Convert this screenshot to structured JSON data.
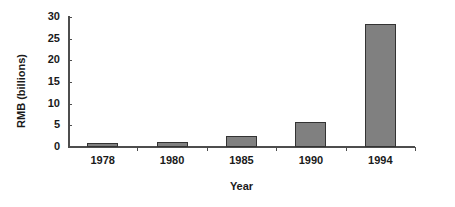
{
  "chart_data": {
    "type": "bar",
    "title": "",
    "subtitle": "",
    "categories": [
      "1978",
      "1980",
      "1985",
      "1990",
      "1994"
    ],
    "values": [
      0.9,
      1.2,
      2.5,
      5.8,
      28.5
    ],
    "series": [
      {
        "name": "RMB (billions)",
        "values": [
          0.9,
          1.2,
          2.5,
          5.8,
          28.5
        ]
      }
    ],
    "xlabel": "Year",
    "ylabel": "RMB (billions)",
    "ylim": [
      0,
      30
    ],
    "yticks": [
      "0",
      "5",
      "10",
      "15",
      "20",
      "25",
      "30"
    ],
    "ytick_values": [
      0,
      5,
      10,
      15,
      20,
      25,
      30
    ],
    "grid": false,
    "legend": false,
    "legend_position": "none",
    "bar_color": "#808080",
    "bar_border_color": "#333333",
    "axis_color": "#4d4d4d",
    "background_color": "#ffffff",
    "text_color": "#1a1a1a",
    "annotations": []
  }
}
